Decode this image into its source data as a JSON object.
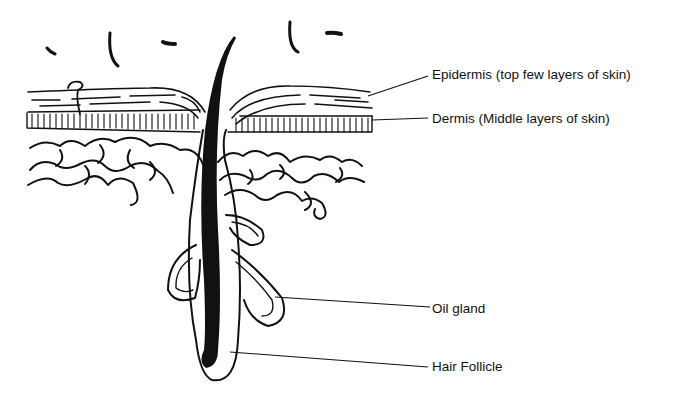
{
  "diagram": {
    "labels": [
      {
        "id": "epidermis",
        "text": "Epidermis (top few layers of skin)"
      },
      {
        "id": "dermis",
        "text": "Dermis (Middle layers of skin)"
      },
      {
        "id": "oil-gland",
        "text": "Oil gland"
      },
      {
        "id": "hair-follicle",
        "text": "Hair Follicle"
      }
    ],
    "colors": {
      "ink": "#111111",
      "background": "#ffffff"
    }
  }
}
